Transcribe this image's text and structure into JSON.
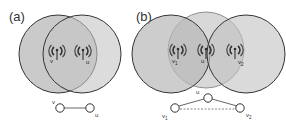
{
  "panels": [
    {
      "id": "a",
      "label": "(a)",
      "nodes": [
        {
          "name": "v",
          "label": "v"
        },
        {
          "name": "u",
          "label": "u"
        }
      ],
      "edges": [
        {
          "from": "v",
          "to": "u",
          "style": "solid"
        }
      ]
    },
    {
      "id": "b",
      "label": "(b)",
      "nodes": [
        {
          "name": "v1",
          "label": "v",
          "sub": "1"
        },
        {
          "name": "u",
          "label": "u"
        },
        {
          "name": "v2",
          "label": "v",
          "sub": "2"
        }
      ],
      "edges": [
        {
          "from": "v1",
          "to": "u",
          "style": "solid"
        },
        {
          "from": "u",
          "to": "v2",
          "style": "solid"
        },
        {
          "from": "v1",
          "to": "v2",
          "style": "dashed"
        }
      ]
    }
  ],
  "colors": {
    "circle_fill": "#bdbdbd",
    "circle_stroke": "#333333",
    "antenna": "#333333",
    "edge": "#555555"
  }
}
